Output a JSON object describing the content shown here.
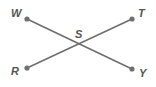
{
  "figure": {
    "type": "geometry-diagram",
    "background_color": "#ffffff",
    "line_color": "#6e6e6e",
    "dot_color": "#707070",
    "label_color": "#555555",
    "canvas": {
      "width": 156,
      "height": 87
    },
    "segments": [
      {
        "name": "segment-WY",
        "from": "W",
        "to": "Y",
        "x1": 27,
        "y1": 19,
        "x2": 132,
        "y2": 69
      },
      {
        "name": "segment-RT",
        "from": "R",
        "to": "T",
        "x1": 27,
        "y1": 68,
        "x2": 132,
        "y2": 19
      }
    ],
    "points": [
      {
        "label": "W",
        "x": 27,
        "y": 19,
        "marked": true
      },
      {
        "label": "T",
        "x": 132,
        "y": 19,
        "marked": true
      },
      {
        "label": "S",
        "x": 80,
        "y": 44,
        "marked": false
      },
      {
        "label": "R",
        "x": 27,
        "y": 68,
        "marked": true
      },
      {
        "label": "Y",
        "x": 132,
        "y": 69,
        "marked": true
      }
    ],
    "labels": {
      "w": "W",
      "t": "T",
      "s": "S",
      "r": "R",
      "y": "Y"
    }
  }
}
